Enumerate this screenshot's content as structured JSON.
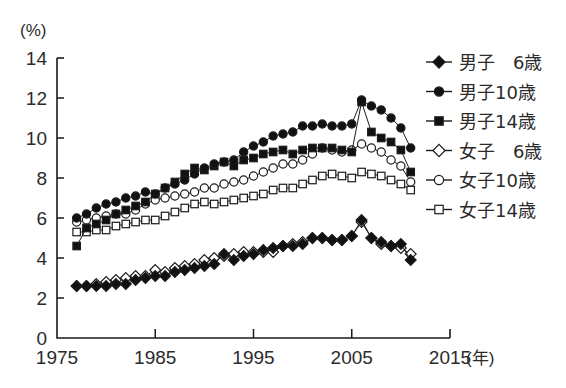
{
  "chart_data": {
    "type": "line",
    "title": "",
    "xlabel": "(年)",
    "ylabel": "(%)",
    "yunit_label": "(%)",
    "xunit_label": "(年)",
    "xlim": [
      1975,
      2015
    ],
    "ylim": [
      0,
      14
    ],
    "ytick_values": [
      0,
      2,
      4,
      6,
      8,
      10,
      12,
      14
    ],
    "ytick_labels": [
      "0",
      "2",
      "4",
      "6",
      "8",
      "10",
      "12",
      "14"
    ],
    "xtick_values": [
      1975,
      1985,
      1995,
      2005,
      2015
    ],
    "xtick_labels": [
      "1975",
      "1985",
      "1995",
      "2005",
      "2015"
    ],
    "grid": false,
    "legend_position": "right",
    "x": [
      1977,
      1978,
      1979,
      1980,
      1981,
      1982,
      1983,
      1984,
      1985,
      1986,
      1987,
      1988,
      1989,
      1990,
      1991,
      1992,
      1993,
      1994,
      1995,
      1996,
      1997,
      1998,
      1999,
      2000,
      2001,
      2002,
      2003,
      2004,
      2005,
      2006,
      2007,
      2008,
      2009,
      2010,
      2011
    ],
    "series": [
      {
        "name": "男子 6歳",
        "label": "男子　6歳",
        "marker": "filled-diamond",
        "color": "#111111",
        "values": [
          2.6,
          2.6,
          2.6,
          2.6,
          2.7,
          2.7,
          2.9,
          3.0,
          3.1,
          3.1,
          3.3,
          3.4,
          3.5,
          3.6,
          3.7,
          4.2,
          3.9,
          4.1,
          4.2,
          4.4,
          4.5,
          4.6,
          4.6,
          4.7,
          5.0,
          5.0,
          4.9,
          4.9,
          5.1,
          5.9,
          5.0,
          4.8,
          4.6,
          4.7,
          3.9
        ]
      },
      {
        "name": "男子10歳",
        "label": "男子10歳",
        "marker": "filled-circle",
        "color": "#111111",
        "values": [
          6.0,
          6.2,
          6.5,
          6.7,
          6.8,
          7.0,
          7.1,
          7.3,
          7.2,
          7.5,
          7.7,
          7.9,
          8.2,
          8.5,
          8.7,
          8.8,
          8.9,
          9.3,
          9.6,
          9.8,
          10.1,
          10.2,
          10.3,
          10.6,
          10.6,
          10.7,
          10.6,
          10.6,
          10.7,
          11.9,
          11.6,
          11.4,
          11.0,
          10.5,
          9.5
        ]
      },
      {
        "name": "男子14歳",
        "label": "男子14歳",
        "marker": "filled-square",
        "color": "#111111",
        "values": [
          4.6,
          5.5,
          5.7,
          5.9,
          6.2,
          6.4,
          6.6,
          6.8,
          7.2,
          7.5,
          7.8,
          8.2,
          8.5,
          8.4,
          8.6,
          8.8,
          8.6,
          8.9,
          9.0,
          9.2,
          9.3,
          9.4,
          9.2,
          9.4,
          9.5,
          9.5,
          9.5,
          9.4,
          9.3,
          11.8,
          10.3,
          10.0,
          9.8,
          9.4,
          8.3
        ]
      },
      {
        "name": "女子 6歳",
        "label": "女子　6歳",
        "marker": "open-diamond",
        "color": "#111111",
        "values": [
          2.6,
          2.6,
          2.7,
          2.8,
          2.9,
          3.0,
          3.1,
          3.1,
          3.4,
          3.3,
          3.5,
          3.6,
          3.7,
          3.9,
          4.0,
          4.1,
          4.2,
          4.3,
          4.3,
          4.3,
          4.3,
          4.6,
          4.7,
          4.8,
          5.0,
          5.0,
          4.9,
          4.9,
          5.1,
          5.8,
          5.0,
          4.7,
          4.6,
          4.5,
          4.2
        ]
      },
      {
        "name": "女子10歳",
        "label": "女子10歳",
        "marker": "open-circle",
        "color": "#111111",
        "values": [
          5.8,
          5.9,
          6.0,
          6.1,
          6.2,
          6.2,
          6.4,
          6.7,
          6.9,
          7.0,
          7.1,
          7.2,
          7.3,
          7.5,
          7.5,
          7.7,
          7.8,
          7.9,
          8.1,
          8.3,
          8.5,
          8.7,
          8.7,
          8.9,
          9.2,
          9.5,
          9.4,
          9.3,
          9.4,
          9.7,
          9.5,
          9.3,
          8.9,
          8.6,
          7.8
        ]
      },
      {
        "name": "女子14歳",
        "label": "女子14歳",
        "marker": "open-square",
        "color": "#111111",
        "values": [
          5.3,
          5.3,
          5.4,
          5.4,
          5.6,
          5.7,
          5.8,
          5.9,
          5.9,
          6.1,
          6.3,
          6.5,
          6.7,
          6.8,
          6.7,
          6.8,
          6.9,
          7.0,
          7.1,
          7.2,
          7.4,
          7.5,
          7.5,
          7.7,
          7.9,
          8.1,
          8.2,
          8.1,
          8.0,
          8.3,
          8.2,
          8.1,
          7.9,
          7.7,
          7.4
        ]
      }
    ]
  }
}
